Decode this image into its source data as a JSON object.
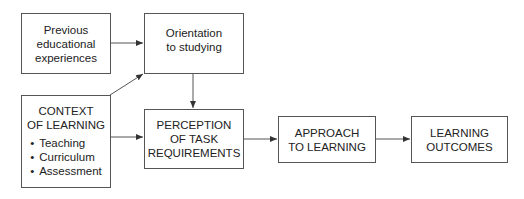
{
  "diagram": {
    "nodes": {
      "previous": {
        "lines": [
          "Previous",
          "educational",
          "experiences"
        ]
      },
      "orientation": {
        "lines": [
          "Orientation",
          "to studying"
        ]
      },
      "context": {
        "lines": [
          "CONTEXT",
          "OF LEARNING"
        ],
        "items": [
          "Teaching",
          "Curriculum",
          "Assessment"
        ]
      },
      "perception": {
        "lines": [
          "PERCEPTION",
          "OF TASK",
          "REQUIREMENTS"
        ]
      },
      "approach": {
        "lines": [
          "APPROACH",
          "TO LEARNING"
        ]
      },
      "outcomes": {
        "lines": [
          "LEARNING",
          "OUTCOMES"
        ]
      }
    },
    "edges": [
      {
        "from": "Previous educational experiences",
        "to": "Orientation to studying"
      },
      {
        "from": "CONTEXT OF LEARNING",
        "to": "Orientation to studying"
      },
      {
        "from": "Orientation to studying",
        "to": "PERCEPTION OF TASK REQUIREMENTS"
      },
      {
        "from": "CONTEXT OF LEARNING",
        "to": "PERCEPTION OF TASK REQUIREMENTS"
      },
      {
        "from": "PERCEPTION OF TASK REQUIREMENTS",
        "to": "APPROACH TO LEARNING"
      },
      {
        "from": "APPROACH TO LEARNING",
        "to": "LEARNING OUTCOMES"
      }
    ],
    "colors": {
      "stroke": "#555555",
      "text": "#222222",
      "background": "#ffffff"
    }
  }
}
